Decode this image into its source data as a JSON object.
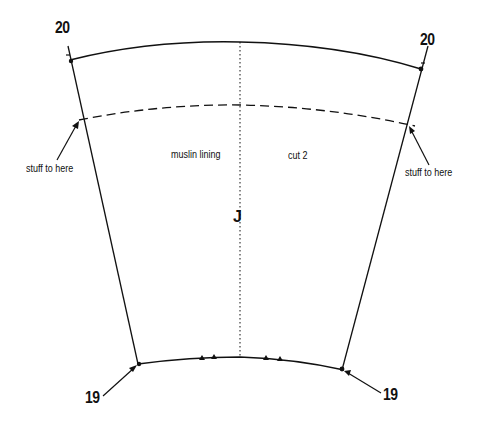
{
  "pattern_piece": {
    "piece_letter": "J",
    "center_text_left": "muslin lining",
    "center_text_right": "cut 2",
    "annotations": {
      "stuff_left": "stuff to here",
      "stuff_right": "stuff to here"
    },
    "point_labels": {
      "top_left": "20",
      "top_right": "20",
      "bottom_left": "19",
      "bottom_right": "19"
    },
    "colors": {
      "line": "#111111",
      "background": "#ffffff"
    }
  }
}
